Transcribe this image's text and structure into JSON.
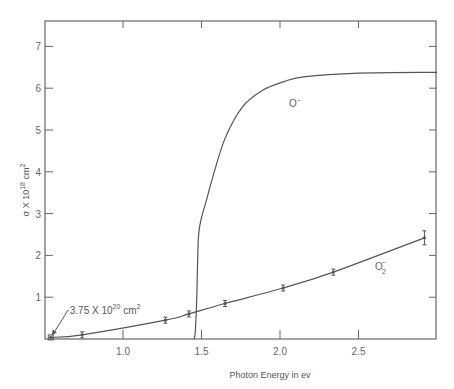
{
  "chart_data": {
    "type": "line",
    "title": "",
    "xlabel": "Photon Energy in ev",
    "ylabel": "σ X 10^18 cm^2",
    "xlim": [
      0.5,
      3.0
    ],
    "ylim": [
      0,
      7.6
    ],
    "x_ticks": [
      "1.0",
      "1.5",
      "2.0",
      "2.5"
    ],
    "y_ticks": [
      "1",
      "2",
      "3",
      "4",
      "5",
      "6",
      "7"
    ],
    "grid": false,
    "legend": "inline labels",
    "series": [
      {
        "name": "O⁻",
        "label_text": "O",
        "label_sup": "−",
        "style": "smooth curve, no markers",
        "x": [
          1.45,
          1.46,
          1.47,
          1.48,
          1.5,
          1.53,
          1.57,
          1.65,
          1.76,
          1.89,
          2.02,
          2.15,
          2.5,
          3.0
        ],
        "y": [
          0.0,
          0.15,
          1.0,
          2.4,
          2.9,
          3.3,
          3.85,
          4.8,
          5.55,
          5.95,
          6.15,
          6.27,
          6.36,
          6.38
        ]
      },
      {
        "name": "O₂⁻",
        "label_text": "O",
        "label_sub": "2",
        "label_sup": "−",
        "style": "curve with data point markers and error bars",
        "x": [
          0.54,
          0.74,
          1.27,
          1.42,
          1.65,
          2.02,
          2.34,
          2.92
        ],
        "y": [
          0.0375,
          0.1,
          0.45,
          0.6,
          0.85,
          1.22,
          1.6,
          2.42
        ]
      }
    ],
    "annotations": [
      {
        "text": "3.75 X 10^20 cm^2",
        "main": "3.75 X 10",
        "exp": "20",
        "unit": " cm",
        "unit_exp": "2",
        "points_to": {
          "x": 0.54,
          "y": 0.0375
        }
      }
    ]
  }
}
